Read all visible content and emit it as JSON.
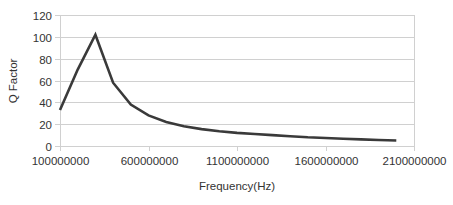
{
  "chart_data": {
    "type": "line",
    "title": "",
    "xlabel": "Frequency(Hz)",
    "ylabel": "Q Factor",
    "xlim": [
      100000000,
      2100000000
    ],
    "ylim": [
      0,
      120
    ],
    "x_ticks": [
      100000000,
      600000000,
      1100000000,
      1600000000,
      2100000000
    ],
    "x_tick_labels": [
      "100000000",
      "600000000",
      "1100000000",
      "1600000000",
      "2100000000"
    ],
    "y_ticks": [
      0,
      20,
      40,
      60,
      80,
      100,
      120
    ],
    "y_tick_labels": [
      "0",
      "20",
      "40",
      "60",
      "80",
      "100",
      "120"
    ],
    "grid": true,
    "legend": null,
    "series": [
      {
        "name": "Q Factor",
        "color": "#3a3a3a",
        "x": [
          100000000,
          200000000,
          300000000,
          400000000,
          500000000,
          600000000,
          700000000,
          800000000,
          900000000,
          1000000000,
          1100000000,
          1200000000,
          1300000000,
          1400000000,
          1500000000,
          1600000000,
          1700000000,
          1800000000,
          1900000000,
          2000000000
        ],
        "values": [
          33,
          70,
          102,
          58,
          38,
          28,
          22,
          18,
          15.5,
          13.5,
          12,
          11,
          10,
          9,
          8,
          7.3,
          6.6,
          6,
          5.5,
          5
        ]
      }
    ]
  }
}
